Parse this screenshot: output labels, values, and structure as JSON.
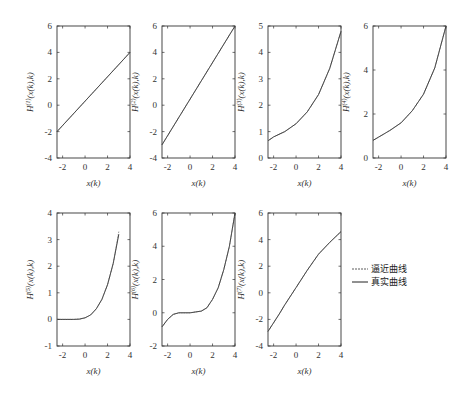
{
  "chart_data": [
    {
      "type": "line",
      "title": "",
      "xlabel": "x(k)",
      "ylabel": "H^(1)(x(k),k)",
      "xlim": [
        -2.5,
        4
      ],
      "ylim": [
        -4,
        6
      ],
      "xticks": [
        -2,
        0,
        2,
        4
      ],
      "yticks": [
        -4,
        -2,
        0,
        2,
        4,
        6
      ],
      "grid": false,
      "series": [
        {
          "name": "真实曲线",
          "x": [
            -2.5,
            4
          ],
          "y": [
            -2,
            4
          ]
        },
        {
          "name": "逼近曲线",
          "x": [
            -2.5,
            4
          ],
          "y": [
            -2,
            4
          ]
        }
      ]
    },
    {
      "type": "line",
      "title": "",
      "xlabel": "x(k)",
      "ylabel": "H^(2)(x(k),k)",
      "xlim": [
        -2.5,
        4
      ],
      "ylim": [
        -4,
        6
      ],
      "xticks": [
        -2,
        0,
        2,
        4
      ],
      "yticks": [
        -4,
        -2,
        0,
        2,
        4,
        6
      ],
      "grid": false,
      "series": [
        {
          "name": "真实曲线",
          "x": [
            -2.5,
            4
          ],
          "y": [
            -3,
            6
          ]
        },
        {
          "name": "逼近曲线",
          "x": [
            -2.5,
            4
          ],
          "y": [
            -3,
            6
          ]
        }
      ]
    },
    {
      "type": "line",
      "title": "",
      "xlabel": "x(k)",
      "ylabel": "H^(3)(x(k),k)",
      "xlim": [
        -2.5,
        4
      ],
      "ylim": [
        0,
        5
      ],
      "xticks": [
        -2,
        0,
        2,
        4
      ],
      "yticks": [
        0,
        1,
        2,
        3,
        4,
        5
      ],
      "grid": false,
      "series": [
        {
          "name": "真实曲线",
          "x": [
            -2.5,
            -2,
            -1,
            0,
            1,
            2,
            3,
            4
          ],
          "y": [
            0.65,
            0.8,
            1.0,
            1.3,
            1.75,
            2.4,
            3.4,
            4.8
          ]
        },
        {
          "name": "逼近曲线",
          "x": [
            -2.5,
            -2,
            -1,
            0,
            1,
            2,
            3,
            4
          ],
          "y": [
            0.65,
            0.8,
            1.0,
            1.3,
            1.75,
            2.4,
            3.4,
            4.8
          ]
        }
      ]
    },
    {
      "type": "line",
      "title": "",
      "xlabel": "x(k)",
      "ylabel": "H^(4)(x(k),k)",
      "xlim": [
        -2.5,
        4
      ],
      "ylim": [
        0,
        6
      ],
      "xticks": [
        -2,
        0,
        2,
        4
      ],
      "yticks": [
        0,
        2,
        4,
        6
      ],
      "grid": false,
      "series": [
        {
          "name": "真实曲线",
          "x": [
            -2.5,
            -2,
            -1,
            0,
            1,
            2,
            3,
            4
          ],
          "y": [
            0.8,
            0.95,
            1.25,
            1.6,
            2.15,
            2.9,
            4.1,
            6.0
          ]
        },
        {
          "name": "逼近曲线",
          "x": [
            -2.5,
            -2,
            -1,
            0,
            1,
            2,
            3,
            4
          ],
          "y": [
            0.8,
            0.95,
            1.25,
            1.6,
            2.15,
            2.9,
            4.1,
            6.0
          ]
        }
      ]
    },
    {
      "type": "line",
      "title": "",
      "xlabel": "x(k)",
      "ylabel": "H^(5)(x(k),k)",
      "xlim": [
        -2.5,
        4
      ],
      "ylim": [
        -1,
        4
      ],
      "xticks": [
        -2,
        0,
        2,
        4
      ],
      "yticks": [
        -1,
        0,
        1,
        2,
        3,
        4
      ],
      "grid": false,
      "series": [
        {
          "name": "真实曲线",
          "x": [
            -2.5,
            -1,
            -0.5,
            0,
            0.5,
            1,
            1.5,
            2,
            2.5,
            3
          ],
          "y": [
            0,
            0,
            0.01,
            0.06,
            0.17,
            0.4,
            0.75,
            1.3,
            2.1,
            3.2
          ]
        },
        {
          "name": "逼近曲线",
          "x": [
            -2.5,
            -1,
            -0.5,
            0,
            0.5,
            1,
            1.5,
            2,
            2.5,
            3
          ],
          "y": [
            0,
            0,
            0.01,
            0.06,
            0.17,
            0.4,
            0.75,
            1.3,
            2.1,
            3.3
          ]
        }
      ]
    },
    {
      "type": "line",
      "title": "",
      "xlabel": "x(k)",
      "ylabel": "H^(6)(x(k),k)",
      "xlim": [
        -2.5,
        4
      ],
      "ylim": [
        -2,
        6
      ],
      "xticks": [
        -2,
        0,
        2,
        4
      ],
      "yticks": [
        -2,
        0,
        2,
        4,
        6
      ],
      "grid": false,
      "series": [
        {
          "name": "真实曲线",
          "x": [
            -2.5,
            -2,
            -1.5,
            -1,
            0,
            1,
            1.5,
            2,
            2.5,
            3,
            3.5,
            4
          ],
          "y": [
            -0.85,
            -0.4,
            -0.1,
            0.0,
            0.0,
            0.1,
            0.3,
            0.8,
            1.5,
            2.6,
            4.0,
            6.0
          ]
        },
        {
          "name": "逼近曲线",
          "x": [
            -2.5,
            -2,
            -1.5,
            -1,
            0,
            1,
            1.5,
            2,
            2.5,
            3,
            3.5,
            4
          ],
          "y": [
            -0.85,
            -0.4,
            -0.1,
            0.0,
            0.0,
            0.1,
            0.3,
            0.8,
            1.5,
            2.6,
            4.0,
            6.0
          ]
        }
      ]
    },
    {
      "type": "line",
      "title": "",
      "xlabel": "x(k)",
      "ylabel": "H^(7)(x(k),k)",
      "xlim": [
        -2.5,
        4
      ],
      "ylim": [
        -4,
        6
      ],
      "xticks": [
        -2,
        0,
        2,
        4
      ],
      "yticks": [
        -4,
        -2,
        0,
        2,
        4,
        6
      ],
      "grid": false,
      "series": [
        {
          "name": "真实曲线",
          "x": [
            -2.5,
            -1.5,
            -1,
            0,
            1,
            2,
            3,
            4
          ],
          "y": [
            -2.9,
            -1.6,
            -0.9,
            0.4,
            1.7,
            2.9,
            3.8,
            4.6
          ]
        },
        {
          "name": "逼近曲线",
          "x": [
            -2.5,
            -1.5,
            -1,
            0,
            1,
            2,
            3,
            4
          ],
          "y": [
            -2.9,
            -1.6,
            -0.9,
            0.4,
            1.7,
            2.9,
            3.8,
            4.6
          ]
        }
      ]
    }
  ],
  "legend": {
    "items": [
      {
        "label": "逼近曲线",
        "style": "dashed"
      },
      {
        "label": "真实曲线",
        "style": "solid"
      }
    ]
  },
  "panels": [
    {
      "ylabel_main": "H",
      "ylabel_sup": "(1)",
      "ylabel_rest": "(x(k),k)",
      "xlabel": "x(k)"
    },
    {
      "ylabel_main": "H",
      "ylabel_sup": "(2)",
      "ylabel_rest": "(x(k),k)",
      "xlabel": "x(k)"
    },
    {
      "ylabel_main": "H",
      "ylabel_sup": "(3)",
      "ylabel_rest": "(x(k),k)",
      "xlabel": "x(k)"
    },
    {
      "ylabel_main": "H",
      "ylabel_sup": "(4)",
      "ylabel_rest": "(x(k),k)",
      "xlabel": "x(k)"
    },
    {
      "ylabel_main": "H",
      "ylabel_sup": "(5)",
      "ylabel_rest": "(x(k),k)",
      "xlabel": "x(k)"
    },
    {
      "ylabel_main": "H",
      "ylabel_sup": "(6)",
      "ylabel_rest": "(x(k),k)",
      "xlabel": "x(k)"
    },
    {
      "ylabel_main": "H",
      "ylabel_sup": "(7)",
      "ylabel_rest": "(x(k),k)",
      "xlabel": "x(k)"
    }
  ]
}
